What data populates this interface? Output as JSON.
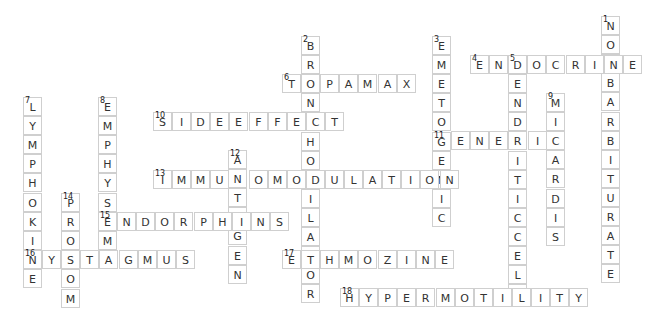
{
  "puzzle": {
    "words": [
      {
        "number": "1",
        "answer": "NONBARBITURATE",
        "direction": "down"
      },
      {
        "number": "2",
        "answer": "BRONCHODILATOR",
        "direction": "down"
      },
      {
        "number": "3",
        "answer": "EMETOGENIC",
        "direction": "down"
      },
      {
        "number": "4",
        "answer": "ENDOCRINE",
        "direction": "across"
      },
      {
        "number": "5",
        "answer": "DENDRITICCELL",
        "direction": "down"
      },
      {
        "number": "6",
        "answer": "TOPAMAX",
        "direction": "across"
      },
      {
        "number": "7",
        "answer": "LYMPHOKINE",
        "direction": "down"
      },
      {
        "number": "8",
        "answer": "EMPHYSEMA",
        "direction": "down"
      },
      {
        "number": "9",
        "answer": "MICARDIS",
        "direction": "down"
      },
      {
        "number": "10",
        "answer": "SIDEEFFECT",
        "direction": "across"
      },
      {
        "number": "11",
        "answer": "GENERIC",
        "direction": "across"
      },
      {
        "number": "12",
        "answer": "ANTIGEN",
        "direction": "down"
      },
      {
        "number": "13",
        "answer": "IMMUNOMODULATION",
        "direction": "across"
      },
      {
        "number": "14",
        "answer": "PROSOM",
        "direction": "down"
      },
      {
        "number": "15",
        "answer": "ENDORPHINS",
        "direction": "across"
      },
      {
        "number": "16",
        "answer": "NYSTAGMUS",
        "direction": "across"
      },
      {
        "number": "17",
        "answer": "ETHMOZINE",
        "direction": "across"
      },
      {
        "number": "18",
        "answer": "HYPERMOTILITY",
        "direction": "across"
      }
    ]
  }
}
